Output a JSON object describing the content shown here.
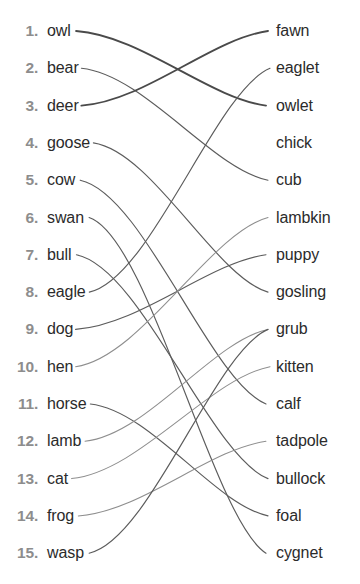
{
  "exercise": {
    "type": "matching-lines",
    "left_column_label": "animals",
    "right_column_label": "young animals",
    "left_items": [
      {
        "number": "1.",
        "word": "owl"
      },
      {
        "number": "2.",
        "word": "bear"
      },
      {
        "number": "3.",
        "word": "deer"
      },
      {
        "number": "4.",
        "word": "goose"
      },
      {
        "number": "5.",
        "word": "cow"
      },
      {
        "number": "6.",
        "word": "swan"
      },
      {
        "number": "7.",
        "word": "bull"
      },
      {
        "number": "8.",
        "word": "eagle"
      },
      {
        "number": "9.",
        "word": "dog"
      },
      {
        "number": "10.",
        "word": "hen"
      },
      {
        "number": "11.",
        "word": "horse"
      },
      {
        "number": "12.",
        "word": "lamb"
      },
      {
        "number": "13.",
        "word": "cat"
      },
      {
        "number": "14.",
        "word": "frog"
      },
      {
        "number": "15.",
        "word": "wasp"
      }
    ],
    "right_items": [
      {
        "word": "fawn"
      },
      {
        "word": "eaglet"
      },
      {
        "word": "owlet"
      },
      {
        "word": "chick"
      },
      {
        "word": "cub"
      },
      {
        "word": "lambkin"
      },
      {
        "word": "puppy"
      },
      {
        "word": "gosling"
      },
      {
        "word": "grub"
      },
      {
        "word": "kitten"
      },
      {
        "word": "calf"
      },
      {
        "word": "tadpole"
      },
      {
        "word": "bullock"
      },
      {
        "word": "foal"
      },
      {
        "word": "cygnet"
      }
    ],
    "connections": [
      {
        "from": 1,
        "to": 3,
        "from_word": "owl",
        "to_word": "owlet",
        "weight": "thick"
      },
      {
        "from": 2,
        "to": 5,
        "from_word": "bear",
        "to_word": "cub",
        "weight": "normal"
      },
      {
        "from": 3,
        "to": 1,
        "from_word": "deer",
        "to_word": "fawn",
        "weight": "thick"
      },
      {
        "from": 4,
        "to": 8,
        "from_word": "goose",
        "to_word": "gosling",
        "weight": "normal"
      },
      {
        "from": 5,
        "to": 11,
        "from_word": "cow",
        "to_word": "calf",
        "weight": "normal"
      },
      {
        "from": 6,
        "to": 15,
        "from_word": "swan",
        "to_word": "cygnet",
        "weight": "normal"
      },
      {
        "from": 7,
        "to": 13,
        "from_word": "bull",
        "to_word": "bullock",
        "weight": "normal"
      },
      {
        "from": 8,
        "to": 2,
        "from_word": "eagle",
        "to_word": "eaglet",
        "weight": "normal"
      },
      {
        "from": 9,
        "to": 7,
        "from_word": "dog",
        "to_word": "puppy",
        "weight": "normal"
      },
      {
        "from": 10,
        "to": 6,
        "from_word": "hen",
        "to_word": "lambkin",
        "weight": "light"
      },
      {
        "from": 11,
        "to": 14,
        "from_word": "horse",
        "to_word": "foal",
        "weight": "normal"
      },
      {
        "from": 12,
        "to": 9,
        "from_word": "lamb",
        "to_word": "grub",
        "weight": "light"
      },
      {
        "from": 13,
        "to": 10,
        "from_word": "cat",
        "to_word": "kitten",
        "weight": "light"
      },
      {
        "from": 14,
        "to": 12,
        "from_word": "frog",
        "to_word": "tadpole",
        "weight": "light"
      },
      {
        "from": 15,
        "to": 9,
        "from_word": "wasp",
        "to_word": "grub",
        "weight": "normal"
      }
    ],
    "unmatched_right": [
      "chick"
    ],
    "colors": {
      "background": "#ffffff",
      "number": "#8d8d8d",
      "word": "#2b2b2b",
      "line": "#5c5c5c",
      "line_thick": "#4a4a4a",
      "line_light": "#8e8e8e"
    },
    "layout": {
      "first_row_y": 31,
      "row_spacing": 37.3,
      "left_text_x": 42,
      "right_text_x": 276,
      "line_start_x_default": 96,
      "line_end_x_default": 268
    }
  }
}
